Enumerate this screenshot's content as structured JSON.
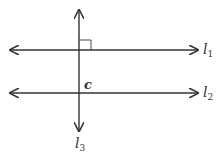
{
  "diagram": {
    "type": "parallel lines cut by transversal",
    "lines": [
      {
        "name": "l1",
        "label_main": "l",
        "label_sub": "1",
        "orientation": "horizontal"
      },
      {
        "name": "l2",
        "label_main": "l",
        "label_sub": "2",
        "orientation": "horizontal"
      },
      {
        "name": "l3",
        "label_main": "l",
        "label_sub": "3",
        "orientation": "vertical"
      }
    ],
    "point_label": "c",
    "right_angle_marker": "at intersection of l1 and l3 (upper-right)",
    "colors": {
      "line": "#333333",
      "background": "#ffffff"
    }
  }
}
